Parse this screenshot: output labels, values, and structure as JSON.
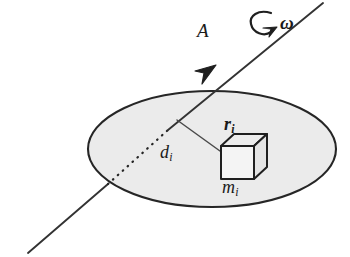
{
  "figure": {
    "background_color": "#ffffff"
  },
  "labels": {
    "axis": "A",
    "angular_velocity": "ω",
    "distance": "d",
    "distance_sub": "i",
    "position_vector": "r",
    "position_vector_sub": "i",
    "mass": "m",
    "mass_sub": "i"
  },
  "colors": {
    "ink": "#1a1a1a",
    "disk_fill": "#ebebeb",
    "disk_stroke": "#262626",
    "axis_stroke": "#333333",
    "cube_stroke": "#1f1f1f",
    "cube_fill": "#f2f2f2",
    "cube_top_fill": "#e6e6e6",
    "cube_side_fill": "#dcdcdc",
    "leader_stroke": "#555555"
  },
  "geometry": {
    "canvas": {
      "width": 350,
      "height": 257
    },
    "disk": {
      "cx": 212,
      "cy": 149,
      "rx": 124,
      "ry": 58
    },
    "axis_line": {
      "x1": 30,
      "y1": 252,
      "x2": 322,
      "y2": 4
    },
    "axis_arrowhead": {
      "x": 212,
      "y": 69
    },
    "hidden_segment": {
      "x1": 107,
      "y1": 185,
      "x2": 166,
      "y2": 131
    },
    "rotation_arrow": {
      "cx": 263,
      "cy": 23,
      "r": 11
    },
    "cube": {
      "x": 218,
      "y": 142,
      "size": 34,
      "depth": 13
    },
    "r_vector": {
      "x1": 177,
      "y1": 120,
      "x2": 237,
      "y2": 163
    }
  }
}
